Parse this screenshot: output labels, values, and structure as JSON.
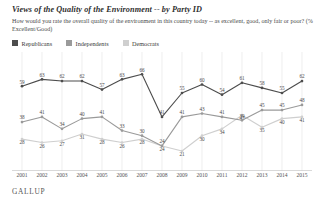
{
  "title": "Views of the Quality of the Environment -- by Party ID",
  "subtitle": "How would you rate the overall quality of the environment in this country today -- as excellent, good, only fair or poor? (% Excellent/Good)",
  "brand": "GALLUP",
  "colors": {
    "republicans": "#4d4d4d",
    "independents": "#9a9a9a",
    "democrats": "#cfcfcf",
    "grid": "#e2e2e2",
    "axis": "#c9c9c9",
    "text": "#3a3a3a"
  },
  "legend": {
    "position": "top-left",
    "items": [
      {
        "label": "Republicans",
        "color": "#4d4d4d"
      },
      {
        "label": "Independents",
        "color": "#9a9a9a"
      },
      {
        "label": "Democrats",
        "color": "#cfcfcf"
      }
    ]
  },
  "chart_data": {
    "type": "line",
    "title": "Views of the Quality of the Environment -- by Party ID",
    "subtitle": "How would you rate the overall quality of the environment in this country today -- as excellent, good, only fair or poor? (% Excellent/Good)",
    "xlabel": "",
    "ylabel": "",
    "ylim": [
      14,
      72
    ],
    "grid": true,
    "grid_axis": "x",
    "legend_position": "top-left",
    "categories": [
      "2001",
      "2002",
      "2003",
      "2004",
      "2005",
      "2006",
      "2007",
      "2008",
      "2009",
      "2010",
      "2011",
      "2012",
      "2013",
      "2014",
      "2015"
    ],
    "series": [
      {
        "name": "Republicans",
        "color": "#4d4d4d",
        "values": [
          59,
          63,
          62,
          62,
          57,
          63,
          66,
          41,
          55,
          60,
          54,
          61,
          58,
          55,
          62
        ]
      },
      {
        "name": "Independents",
        "color": "#9a9a9a",
        "values": [
          38,
          41,
          34,
          40,
          41,
          33,
          30,
          24,
          41,
          43,
          41,
          39,
          45,
          45,
          48
        ]
      },
      {
        "name": "Democrats",
        "color": "#cfcfcf",
        "values": [
          28,
          26,
          27,
          31,
          28,
          26,
          28,
          24,
          21,
          30,
          34,
          42,
          35,
          40,
          41
        ]
      }
    ]
  }
}
